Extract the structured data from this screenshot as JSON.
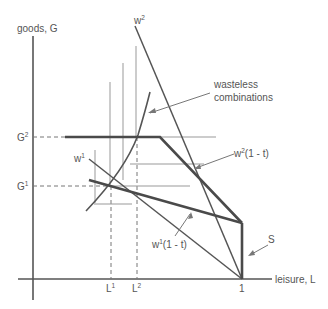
{
  "diagram": {
    "axes": {
      "y_label": "goods, G",
      "x_label": "leisure, L"
    },
    "y_ticks": [
      {
        "base": "G",
        "sup": "2"
      },
      {
        "base": "G",
        "sup": "1"
      }
    ],
    "x_ticks": [
      {
        "base": "L",
        "sup": "1"
      },
      {
        "base": "L",
        "sup": "2"
      },
      {
        "base": "1",
        "sup": ""
      }
    ],
    "line_labels": {
      "w2": {
        "base": "w",
        "sup": "2"
      },
      "w1": {
        "base": "w",
        "sup": "1"
      },
      "w2_1_t": {
        "base": "w",
        "sup": "2",
        "rest": "(1 - t)"
      },
      "w1_1_t": {
        "base": "w",
        "sup": "1",
        "rest": "(1 - t)"
      },
      "S": "S"
    },
    "annotations": {
      "wasteless_line1": "wasteless",
      "wasteless_line2": "combinations"
    },
    "colors": {
      "line": "#555555",
      "thick": "#4a4a4a",
      "thin": "#888888",
      "text": "#555555"
    }
  }
}
